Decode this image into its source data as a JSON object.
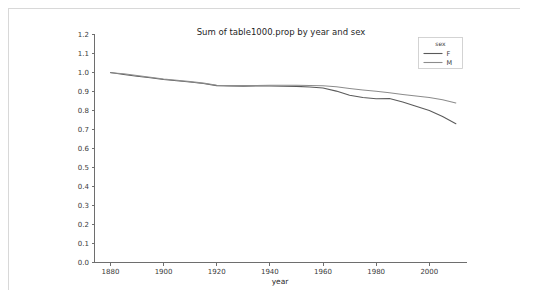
{
  "figure": {
    "title": "Sum of table1000.prop by year and sex",
    "background": "#ffffff",
    "border_color": "#d8d8d8"
  },
  "axes": {
    "xlabel": "year",
    "ylabel": "",
    "x_ticks": [
      "1880",
      "1900",
      "1920",
      "1940",
      "1960",
      "1980",
      "2000"
    ],
    "x_tick_values": [
      1880,
      1900,
      1920,
      1940,
      1960,
      1980,
      2000
    ],
    "y_ticks": [
      "0.0",
      "0.1",
      "0.2",
      "0.3",
      "0.4",
      "0.5",
      "0.6",
      "0.7",
      "0.8",
      "0.9",
      "1.0",
      "1.1",
      "1.2"
    ],
    "y_tick_values": [
      0.0,
      0.1,
      0.2,
      0.3,
      0.4,
      0.5,
      0.6,
      0.7,
      0.8,
      0.9,
      1.0,
      1.1,
      1.2
    ],
    "xlim": [
      1874,
      2014
    ],
    "ylim": [
      0.0,
      1.2
    ],
    "grid": false,
    "axis_color": "#6e6e6e"
  },
  "legend": {
    "title": "sex",
    "position": "upper right",
    "entries": [
      {
        "label": "F",
        "color": "#5a5a5a"
      },
      {
        "label": "M",
        "color": "#8c8c8c"
      }
    ]
  },
  "chart_data": {
    "type": "line",
    "title": "Sum of table1000.prop by year and sex",
    "xlabel": "year",
    "ylabel": "",
    "xlim": [
      1874,
      2014
    ],
    "ylim": [
      0.0,
      1.2
    ],
    "grid": false,
    "legend_position": "upper right",
    "legend_title": "sex",
    "x": [
      1880,
      1885,
      1890,
      1895,
      1900,
      1905,
      1910,
      1915,
      1920,
      1925,
      1930,
      1935,
      1940,
      1945,
      1950,
      1955,
      1960,
      1965,
      1970,
      1975,
      1980,
      1985,
      1990,
      1995,
      2000,
      2005,
      2010
    ],
    "series": [
      {
        "name": "F",
        "color": "#5a5a5a",
        "values": [
          1.0,
          0.99,
          0.98,
          0.972,
          0.963,
          0.957,
          0.95,
          0.942,
          0.931,
          0.929,
          0.928,
          0.929,
          0.929,
          0.928,
          0.927,
          0.924,
          0.918,
          0.902,
          0.88,
          0.868,
          0.862,
          0.863,
          0.845,
          0.822,
          0.8,
          0.768,
          0.73
        ]
      },
      {
        "name": "M",
        "color": "#8c8c8c",
        "values": [
          0.999,
          0.993,
          0.984,
          0.975,
          0.966,
          0.959,
          0.952,
          0.944,
          0.933,
          0.931,
          0.931,
          0.932,
          0.933,
          0.933,
          0.933,
          0.932,
          0.93,
          0.925,
          0.916,
          0.908,
          0.901,
          0.893,
          0.884,
          0.876,
          0.868,
          0.857,
          0.84
        ]
      }
    ]
  }
}
